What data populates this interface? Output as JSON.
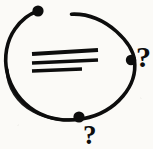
{
  "image": {
    "title": "Hand-drawn circle sketch with question marks",
    "width": 153,
    "height": 149,
    "background_color": "#fbfaf7",
    "ink_color": "#0d0d0d",
    "style": "hand-drawn ink sketch"
  },
  "annotations": {
    "question_mark_right": "?",
    "question_mark_bottom": "?"
  },
  "shapes": {
    "circle_label": "open circle outline",
    "dots": [
      {
        "name": "top-left-dot",
        "cx": 38,
        "cy": 11,
        "r": 5.6
      },
      {
        "name": "right-dot",
        "cx": 131,
        "cy": 60,
        "r": 5.2
      },
      {
        "name": "bottom-dot",
        "cx": 79,
        "cy": 117,
        "r": 5.6
      }
    ],
    "lines": [
      {
        "name": "line-1",
        "x1": 32,
        "y1": 54,
        "x2": 98,
        "y2": 50,
        "weight": 4.2
      },
      {
        "name": "line-2",
        "x1": 32,
        "y1": 63,
        "x2": 98,
        "y2": 60,
        "weight": 3.6
      },
      {
        "name": "line-3",
        "x1": 32,
        "y1": 71,
        "x2": 82,
        "y2": 69,
        "weight": 3.4
      }
    ],
    "arc_gap": "top of circle between top-left dot and upper-right arc"
  }
}
